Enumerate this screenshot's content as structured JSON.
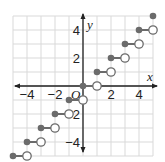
{
  "chart_data": {
    "type": "scatter",
    "subtype": "step-function",
    "title": "",
    "xlabel": "x",
    "ylabel": "y",
    "origin_label": "O",
    "xlim": [
      -5,
      5
    ],
    "ylim": [
      -5,
      5
    ],
    "grid": true,
    "x_ticks": [
      -4,
      -2,
      2,
      4
    ],
    "y_ticks": [
      4,
      2,
      -2,
      -4
    ],
    "x_tick_labels": [
      "−4",
      "−2",
      "2",
      "4"
    ],
    "y_tick_labels": [
      "4",
      "2",
      "−2",
      "−4"
    ],
    "segments": [
      {
        "closed": [
          -5,
          -5
        ],
        "open": [
          -4,
          -5
        ]
      },
      {
        "closed": [
          -4,
          -4
        ],
        "open": [
          -3,
          -4
        ]
      },
      {
        "closed": [
          -3,
          -3
        ],
        "open": [
          -2,
          -3
        ]
      },
      {
        "closed": [
          -2,
          -2
        ],
        "open": [
          -1,
          -2
        ]
      },
      {
        "closed": [
          -1,
          -1
        ],
        "open": [
          0,
          -1
        ]
      },
      {
        "closed": [
          0,
          0
        ],
        "open": [
          1,
          0
        ]
      },
      {
        "closed": [
          1,
          1
        ],
        "open": [
          2,
          1
        ]
      },
      {
        "closed": [
          2,
          2
        ],
        "open": [
          3,
          2
        ]
      },
      {
        "closed": [
          3,
          3
        ],
        "open": [
          4,
          3
        ]
      },
      {
        "closed": [
          4,
          4
        ],
        "open": [
          5,
          4
        ]
      }
    ],
    "extra_points": [
      {
        "closed": [
          5,
          5
        ]
      }
    ],
    "colors": {
      "grid": "#d9d9d9",
      "axis": "#222222",
      "point": "#6b6b6b",
      "open_fill": "#ffffff"
    }
  }
}
